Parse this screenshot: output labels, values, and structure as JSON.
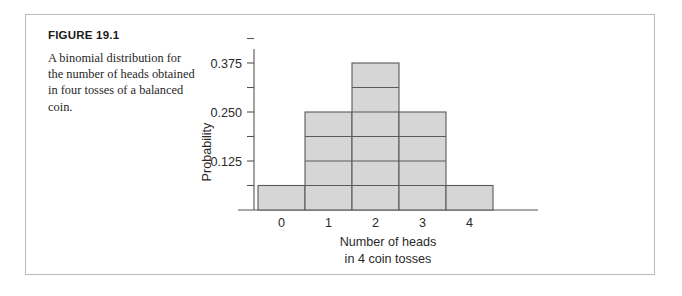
{
  "figure": {
    "number_label": "FIGURE 19.1",
    "caption_line1": "A binomial distribution for",
    "caption_line2": "the number of heads obtained",
    "caption_line3": "in four tosses of a balanced",
    "caption_line4": "coin.",
    "caption_full": "A binomial distribution for the number of heads obtained in four tosses of a balanced coin.",
    "border_color": "#b9b9b9"
  },
  "chart_data": {
    "type": "bar",
    "title": "",
    "subtitle": "",
    "categories": [
      "0",
      "1",
      "2",
      "3",
      "4"
    ],
    "values": [
      0.0625,
      0.25,
      0.375,
      0.25,
      0.0625
    ],
    "xlabel_line1": "Number of heads",
    "xlabel_line2": "in 4 coin tosses",
    "ylabel": "Probability",
    "ylim": [
      0,
      0.4375
    ],
    "xlim": [
      -0.5,
      4.5
    ],
    "y_major_ticks": [
      0.125,
      0.25,
      0.375
    ],
    "y_major_tick_labels": [
      "0.125",
      "0.250",
      "0.375"
    ],
    "y_minor_ticks": [
      0.0625,
      0.1875,
      0.3125,
      0.4375
    ],
    "x_tick_labels": [
      "0",
      "1",
      "2",
      "3",
      "4"
    ],
    "bar_unit": 0.0625,
    "bar_divider_interval": 0.0625,
    "grid": false,
    "legend": "none",
    "bar_fill_color": "#d6d6d6",
    "bar_edge_color": "#5a5a5a",
    "axis_color": "#555555",
    "contiguous_bars": true
  }
}
